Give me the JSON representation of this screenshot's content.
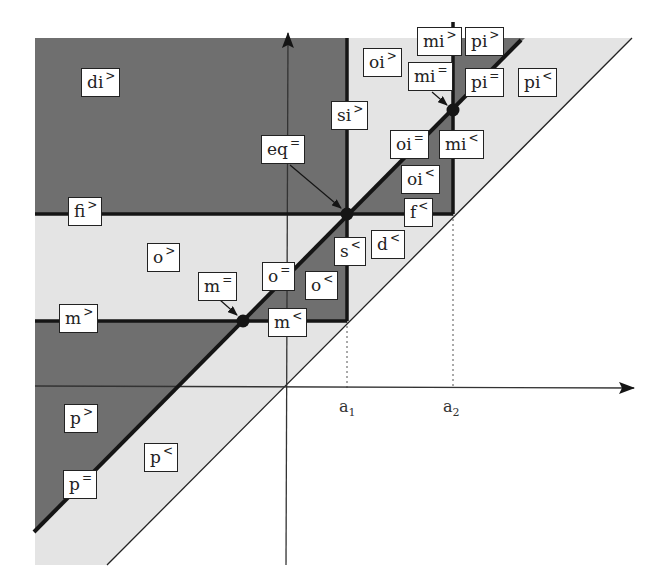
{
  "colors": {
    "dark_region": "#6f6f6f",
    "light_region": "#e4e4e4",
    "line": "#151515",
    "background": "#ffffff"
  },
  "axes": {
    "x_ticks": [
      {
        "base": "a",
        "sub": "1"
      },
      {
        "base": "a",
        "sub": "2"
      }
    ]
  },
  "labels": [
    {
      "id": "di-gt",
      "base": "di",
      "sup": ">"
    },
    {
      "id": "oi-gt",
      "base": "oi",
      "sup": ">"
    },
    {
      "id": "mi-gt",
      "base": "mi",
      "sup": ">"
    },
    {
      "id": "pi-gt",
      "base": "pi",
      "sup": ">"
    },
    {
      "id": "mi-eq",
      "base": "mi",
      "sup": "="
    },
    {
      "id": "pi-eq",
      "base": "pi",
      "sup": "="
    },
    {
      "id": "pi-lt",
      "base": "pi",
      "sup": "<"
    },
    {
      "id": "si-gt",
      "base": "si",
      "sup": ">"
    },
    {
      "id": "eq-eq",
      "base": "eq",
      "sup": "="
    },
    {
      "id": "oi-eq",
      "base": "oi",
      "sup": "="
    },
    {
      "id": "mi-lt",
      "base": "mi",
      "sup": "<"
    },
    {
      "id": "oi-lt",
      "base": "oi",
      "sup": "<"
    },
    {
      "id": "fi-gt",
      "base": "fi",
      "sup": ">"
    },
    {
      "id": "f-lt",
      "base": "f",
      "sup": "<"
    },
    {
      "id": "o-gt",
      "base": "o",
      "sup": ">"
    },
    {
      "id": "s-lt",
      "base": "s",
      "sup": "<"
    },
    {
      "id": "d-lt",
      "base": "d",
      "sup": "<"
    },
    {
      "id": "m-eq",
      "base": "m",
      "sup": "="
    },
    {
      "id": "o-eq",
      "base": "o",
      "sup": "="
    },
    {
      "id": "o-lt",
      "base": "o",
      "sup": "<"
    },
    {
      "id": "m-gt",
      "base": "m",
      "sup": ">"
    },
    {
      "id": "m-lt",
      "base": "m",
      "sup": "<"
    },
    {
      "id": "p-gt",
      "base": "p",
      "sup": ">"
    },
    {
      "id": "p-lt",
      "base": "p",
      "sup": "<"
    },
    {
      "id": "p-eq",
      "base": "p",
      "sup": "="
    }
  ]
}
